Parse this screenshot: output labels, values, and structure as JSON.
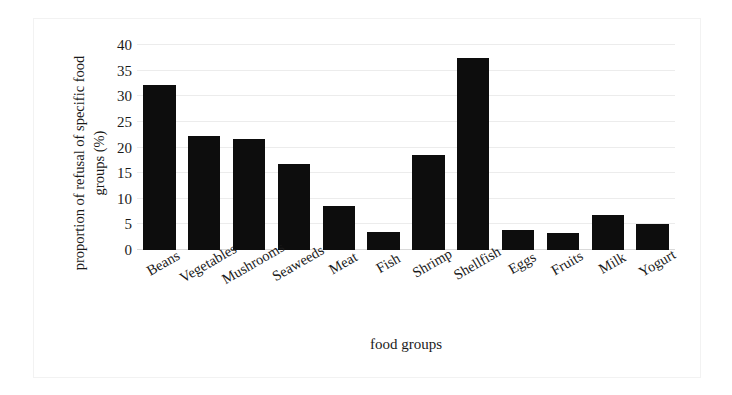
{
  "chart_data": {
    "type": "bar",
    "title": "",
    "xlabel": "food groups",
    "ylabel": "proportion of refusal of specific food groups (%)",
    "ylabel_lines": [
      "proportion of refusal of specific food",
      "groups (%)"
    ],
    "categories": [
      "Beans",
      "Vegetables",
      "Mushrooms",
      "Seaweeds",
      "Meat",
      "Fish",
      "Shrimp",
      "Shellfish",
      "Eggs",
      "Fruits",
      "Milk",
      "Yogurt"
    ],
    "values": [
      32.2,
      22.2,
      21.6,
      16.8,
      8.5,
      3.5,
      18.5,
      37.5,
      4.0,
      3.3,
      6.8,
      5.0
    ],
    "ylim": [
      0,
      40
    ],
    "yticks": [
      40,
      35,
      30,
      25,
      20,
      15,
      10,
      5,
      0
    ],
    "ytick_labels": [
      "40",
      "35",
      "30",
      "25",
      "20",
      "15",
      "10",
      "5",
      "0"
    ],
    "grid": true,
    "grid_axis": "y",
    "legend": false,
    "bar_color": "#0d0d0d",
    "grid_color": "#ececec",
    "background": "#ffffff",
    "xtick_rotation": -30
  }
}
